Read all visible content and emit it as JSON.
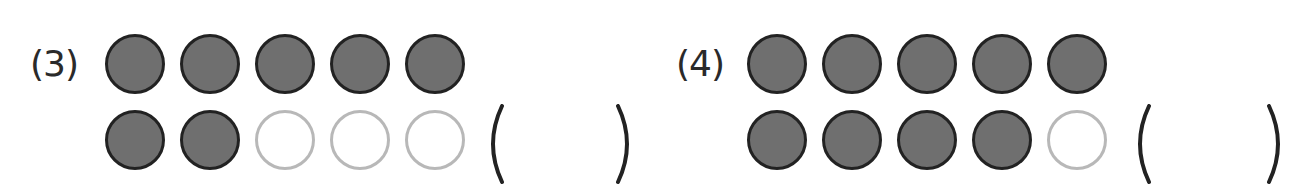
{
  "problems": [
    {
      "label": "(3)",
      "rows": [
        [
          "filled",
          "filled",
          "filled",
          "filled",
          "filled"
        ],
        [
          "filled",
          "filled",
          "empty",
          "empty",
          "empty"
        ]
      ],
      "answer_box": {
        "open": "(",
        "close": ")",
        "value": ""
      }
    },
    {
      "label": "(4)",
      "rows": [
        [
          "filled",
          "filled",
          "filled",
          "filled",
          "filled"
        ],
        [
          "filled",
          "filled",
          "filled",
          "filled",
          "empty"
        ]
      ],
      "answer_box": {
        "open": "(",
        "close": ")",
        "value": ""
      }
    }
  ],
  "colors": {
    "filled_fill": "#6f6f6f",
    "filled_stroke": "#222222",
    "empty_stroke": "#b8b8b8",
    "text": "#2a2a2a"
  }
}
